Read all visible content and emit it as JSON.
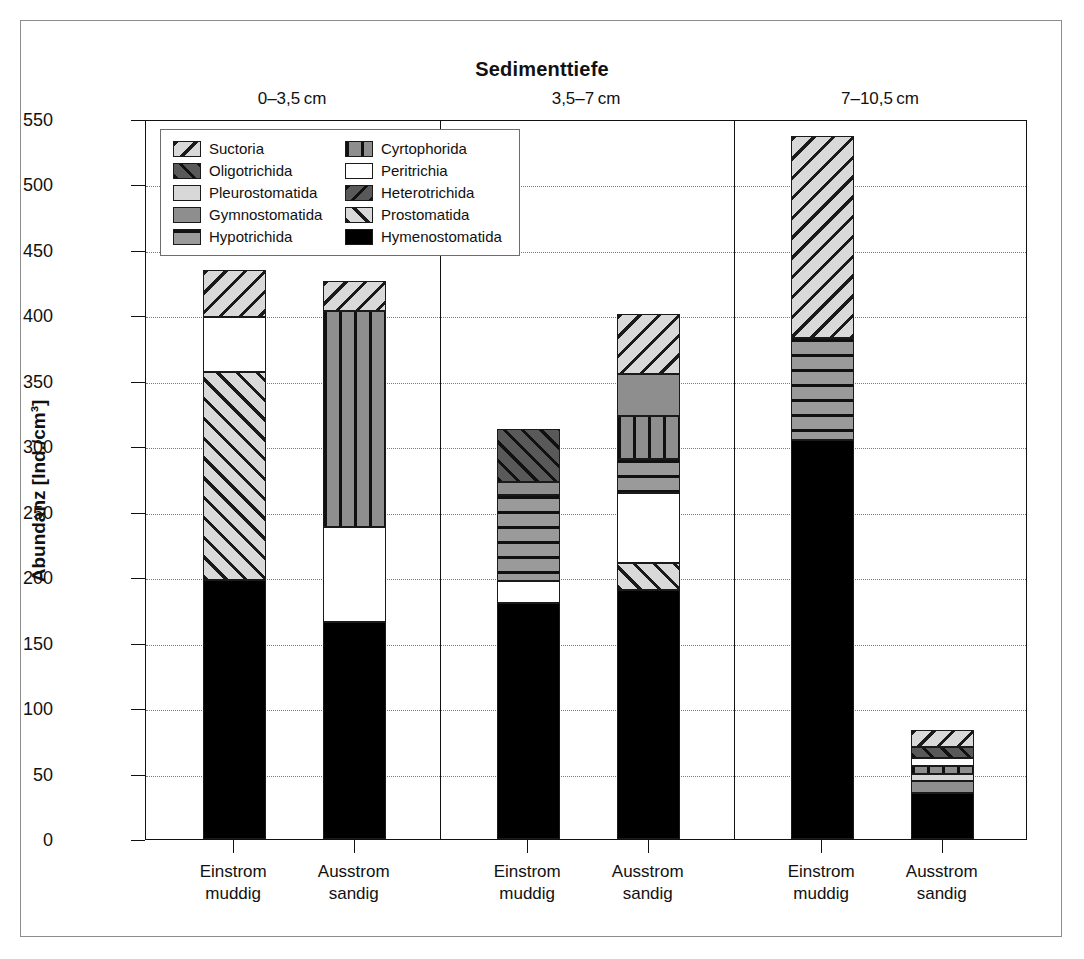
{
  "chart_data": {
    "type": "bar",
    "subtype": "stacked",
    "title": "Sedimenttiefe",
    "xlabel": "",
    "ylabel": "Abundanz [Ind./cm³]",
    "ylim": [
      0,
      550
    ],
    "ytick_step": 50,
    "ytick_labels": [
      "0",
      "50",
      "100",
      "150",
      "200",
      "250",
      "300",
      "350",
      "400",
      "450",
      "500",
      "550"
    ],
    "grid": true,
    "grid_style": "dotted-horizontal",
    "legend_position": "top-left inside plot",
    "panels": [
      {
        "header": "0–3,5 cm",
        "categories": [
          "Einstrom\nmuddig",
          "Ausstrom\nsandig"
        ]
      },
      {
        "header": "3,5–7 cm",
        "categories": [
          "Einstrom\nmuddig",
          "Ausstrom\nsandig"
        ]
      },
      {
        "header": "7–10,5 cm",
        "categories": [
          "Einstrom\nmuddig",
          "Ausstrom\nsandig"
        ]
      }
    ],
    "categories": [
      "0-3,5 cm / Einstrom muddig",
      "0-3,5 cm / Ausstrom sandig",
      "3,5-7 cm / Einstrom muddig",
      "3,5-7 cm / Ausstrom sandig",
      "7-10,5 cm / Einstrom muddig",
      "7-10,5 cm / Ausstrom sandig"
    ],
    "series": [
      {
        "name": "Hymenostomatida",
        "values": [
          198,
          166,
          180,
          190,
          305,
          35
        ]
      },
      {
        "name": "Prostomatida",
        "values": [
          159,
          0,
          0,
          21,
          0,
          0
        ]
      },
      {
        "name": "Gymnostomatida",
        "values": [
          0,
          0,
          10,
          32,
          0,
          9
        ]
      },
      {
        "name": "Pleurostomatida",
        "values": [
          0,
          0,
          0,
          0,
          0,
          6
        ]
      },
      {
        "name": "Cyrtophorida",
        "values": [
          0,
          165,
          0,
          33,
          0,
          6
        ]
      },
      {
        "name": "Peritrichia",
        "values": [
          42,
          72,
          17,
          53,
          0,
          6
        ]
      },
      {
        "name": "Hypotrichida",
        "values": [
          0,
          0,
          66,
          26,
          78,
          0
        ]
      },
      {
        "name": "Oligotrichida",
        "values": [
          0,
          0,
          40,
          0,
          0,
          8
        ]
      },
      {
        "name": "Heterotrichida",
        "values": [
          0,
          0,
          0,
          0,
          0,
          0
        ]
      },
      {
        "name": "Suctoria",
        "values": [
          36,
          23,
          0,
          46,
          154,
          13
        ]
      }
    ],
    "totals": [
      435,
      426,
      313,
      401,
      537,
      83
    ],
    "stacks": [
      {
        "bar": 1,
        "segments": [
          {
            "name": "Hymenostomatida",
            "from": 0,
            "to": 198,
            "value": 198
          },
          {
            "name": "Prostomatida",
            "from": 198,
            "to": 357,
            "value": 159
          },
          {
            "name": "Peritrichia",
            "from": 357,
            "to": 399,
            "value": 42
          },
          {
            "name": "Suctoria",
            "from": 399,
            "to": 435,
            "value": 36
          }
        ]
      },
      {
        "bar": 2,
        "segments": [
          {
            "name": "Hymenostomatida",
            "from": 0,
            "to": 166,
            "value": 166
          },
          {
            "name": "Peritrichia",
            "from": 166,
            "to": 238,
            "value": 72
          },
          {
            "name": "Cyrtophorida",
            "from": 238,
            "to": 403,
            "value": 165
          },
          {
            "name": "Suctoria",
            "from": 403,
            "to": 426,
            "value": 23
          }
        ]
      },
      {
        "bar": 3,
        "segments": [
          {
            "name": "Hymenostomatida",
            "from": 0,
            "to": 180,
            "value": 180
          },
          {
            "name": "Peritrichia",
            "from": 180,
            "to": 197,
            "value": 17
          },
          {
            "name": "Hypotrichida",
            "from": 197,
            "to": 263,
            "value": 66
          },
          {
            "name": "Gymnostomatida",
            "from": 263,
            "to": 273,
            "value": 10
          },
          {
            "name": "Oligotrichida",
            "from": 273,
            "to": 313,
            "value": 40
          }
        ]
      },
      {
        "bar": 4,
        "segments": [
          {
            "name": "Hymenostomatida",
            "from": 0,
            "to": 190,
            "value": 190
          },
          {
            "name": "Prostomatida",
            "from": 190,
            "to": 211,
            "value": 21
          },
          {
            "name": "Peritrichia",
            "from": 211,
            "to": 264,
            "value": 53
          },
          {
            "name": "Hypotrichida",
            "from": 264,
            "to": 290,
            "value": 26
          },
          {
            "name": "Cyrtophorida",
            "from": 290,
            "to": 323,
            "value": 33
          },
          {
            "name": "Gymnostomatida",
            "from": 323,
            "to": 355,
            "value": 32
          },
          {
            "name": "Suctoria",
            "from": 355,
            "to": 401,
            "value": 46
          }
        ]
      },
      {
        "bar": 5,
        "segments": [
          {
            "name": "Hymenostomatida",
            "from": 0,
            "to": 305,
            "value": 305
          },
          {
            "name": "Hypotrichida",
            "from": 305,
            "to": 383,
            "value": 78
          },
          {
            "name": "Suctoria",
            "from": 383,
            "to": 537,
            "value": 154
          }
        ]
      },
      {
        "bar": 6,
        "segments": [
          {
            "name": "Hymenostomatida",
            "from": 0,
            "to": 35,
            "value": 35
          },
          {
            "name": "Gymnostomatida",
            "from": 35,
            "to": 44,
            "value": 9
          },
          {
            "name": "Pleurostomatida",
            "from": 44,
            "to": 50,
            "value": 6
          },
          {
            "name": "Cyrtophorida",
            "from": 50,
            "to": 56,
            "value": 6
          },
          {
            "name": "Peritrichia",
            "from": 56,
            "to": 62,
            "value": 6
          },
          {
            "name": "Oligotrichida",
            "from": 62,
            "to": 70,
            "value": 8
          },
          {
            "name": "Suctoria",
            "from": 70,
            "to": 83,
            "value": 13
          }
        ]
      }
    ],
    "legend": [
      {
        "label": "Suctoria",
        "key": "suctoria"
      },
      {
        "label": "Cyrtophorida",
        "key": "cyrtophorida"
      },
      {
        "label": "Oligotrichida",
        "key": "oligotrichida"
      },
      {
        "label": "Peritrichia",
        "key": "peritrichia"
      },
      {
        "label": "Pleurostomatida",
        "key": "pleurostomatida"
      },
      {
        "label": "Heterotrichida",
        "key": "heterotrichida"
      },
      {
        "label": "Gymnostomatida",
        "key": "gymnostomatida"
      },
      {
        "label": "Prostomatida",
        "key": "prostomatida"
      },
      {
        "label": "Hypotrichida",
        "key": "hypotrichida"
      },
      {
        "label": "Hymenostomatida",
        "key": "hymenostomatida"
      }
    ]
  }
}
